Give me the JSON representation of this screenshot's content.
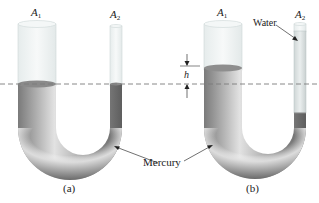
{
  "figure": {
    "panels": [
      {
        "id": "a",
        "caption": "(a)",
        "wide_arm_label": "A",
        "wide_arm_subscript": "1",
        "narrow_arm_label": "A",
        "narrow_arm_subscript": "2"
      },
      {
        "id": "b",
        "caption": "(b)",
        "wide_arm_label": "A",
        "wide_arm_subscript": "1",
        "narrow_arm_label": "A",
        "narrow_arm_subscript": "2",
        "height_label": "h",
        "water_label": "Water"
      }
    ],
    "shared_label": "Mercury",
    "reference_line": "dashed-horizontal",
    "colors": {
      "glass": "#eef2f2",
      "glass_edge": "#c9d3d3",
      "mercury_dark": "#6b6b6b",
      "mercury_light": "#e8e8e8",
      "water": "#dde3e3",
      "dash": "#7a7a7a"
    }
  }
}
